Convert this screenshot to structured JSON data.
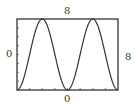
{
  "chart_data": {
    "type": "line",
    "title": "",
    "xlabel": "",
    "ylabel": "",
    "xlim": [
      0,
      8
    ],
    "ylim": [
      0,
      8
    ],
    "x_ticks": 8,
    "y_ticks": 8,
    "grid": false,
    "series": [
      {
        "name": "y = 4 - 4cos(pi x / 2)",
        "x": [
          0,
          0.5,
          1,
          1.5,
          2,
          2.5,
          3,
          3.5,
          4,
          4.5,
          5,
          5.5,
          6,
          6.5,
          7,
          7.5,
          8
        ],
        "values": [
          0,
          1.17,
          4,
          6.83,
          8,
          6.83,
          4,
          1.17,
          0,
          1.17,
          4,
          6.83,
          8,
          6.83,
          4,
          1.17,
          0
        ]
      }
    ],
    "window_labels": {
      "ymax": "8",
      "ymin": "0",
      "xmin": "0",
      "xmax": "8"
    }
  }
}
